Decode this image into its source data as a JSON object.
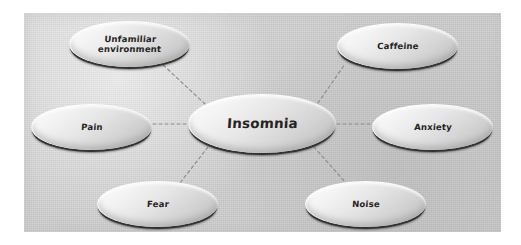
{
  "diagram": {
    "type": "mind-map",
    "canvas": {
      "background_color": "#cdcdcd",
      "page_color": "#ffffff"
    },
    "style": {
      "node_fill_light": "#fdfdfd",
      "node_fill_dark": "#bcbcbc",
      "node_shadow_color": "#34322f",
      "text_color": "#26231f",
      "connector_color": "#8a8a8a",
      "connector_style": "dashed"
    },
    "center_node": {
      "id": "insomnia",
      "label": "Insomnia"
    },
    "nodes": [
      {
        "id": "unfamiliar",
        "label_line1": "Unfamiliar",
        "label_line2": "environment",
        "position": "top-left"
      },
      {
        "id": "caffeine",
        "label": "Caffeine",
        "position": "top-right"
      },
      {
        "id": "pain",
        "label": "Pain",
        "position": "left"
      },
      {
        "id": "anxiety",
        "label": "Anxiety",
        "position": "right"
      },
      {
        "id": "fear",
        "label": "Fear",
        "position": "bottom-left"
      },
      {
        "id": "noise",
        "label": "Noise",
        "position": "bottom-right"
      }
    ],
    "connections": [
      {
        "from": "insomnia",
        "to": "unfamiliar"
      },
      {
        "from": "insomnia",
        "to": "caffeine"
      },
      {
        "from": "insomnia",
        "to": "pain"
      },
      {
        "from": "insomnia",
        "to": "anxiety"
      },
      {
        "from": "insomnia",
        "to": "fear"
      },
      {
        "from": "insomnia",
        "to": "noise"
      }
    ]
  }
}
